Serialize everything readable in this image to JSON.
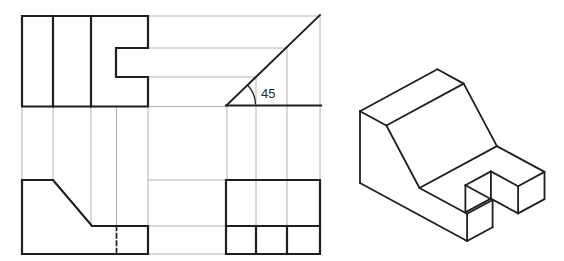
{
  "canvas": {
    "width": 564,
    "height": 261,
    "background": "#ffffff"
  },
  "colors": {
    "outline": "#1f1f1f",
    "projection": "#b4b4b4",
    "label": "#2a2a2a"
  },
  "angle_dimension": {
    "label": "45",
    "x": 261,
    "y": 98,
    "font_size": 13
  },
  "orthographic": {
    "top_view": {
      "outline": "M22,16 H148 V48 H116 V77 H148 V106.5 H22 Z",
      "edges": [
        [
          53,
          16,
          53,
          106.5
        ],
        [
          91,
          16,
          91,
          106.5
        ]
      ]
    },
    "front_view": {
      "outline": "M22,180 H53 L92,226 H148 V254 H22 Z",
      "hidden_edges": [
        [
          116.5,
          226,
          116.5,
          254
        ]
      ]
    },
    "side_view": {
      "outline": "M226,180 H320 V254 H226 Z",
      "edges": [
        [
          226,
          226,
          320,
          226
        ],
        [
          256,
          226,
          256,
          254
        ],
        [
          287,
          226,
          287,
          254
        ]
      ]
    },
    "miter": {
      "baseline": [
        226,
        105.5,
        321,
        105.5
      ],
      "diagonal": [
        227,
        105,
        320,
        15
      ],
      "arc": "M255.5,104.5 A28.5,28.5 0 0 0 247.2,84.8"
    }
  },
  "projection_lines": [
    [
      22,
      107,
      22,
      180
    ],
    [
      53,
      107,
      53,
      180
    ],
    [
      91,
      107,
      91,
      226
    ],
    [
      116.5,
      107,
      116.5,
      226
    ],
    [
      148,
      107,
      148,
      226
    ],
    [
      148,
      16,
      318,
      16
    ],
    [
      148,
      48,
      287,
      48
    ],
    [
      148,
      77,
      256,
      77
    ],
    [
      148,
      106.5,
      227,
      106.5
    ],
    [
      148,
      180,
      226,
      180
    ],
    [
      148,
      226,
      226,
      226
    ],
    [
      148,
      254,
      226,
      254
    ],
    [
      227,
      105,
      227,
      180
    ],
    [
      256,
      76,
      256,
      226
    ],
    [
      287,
      46,
      287,
      226
    ],
    [
      320,
      16,
      320,
      180
    ]
  ],
  "isometric": {
    "edges": [
      [
        360,
        111.2,
        437.4,
        69.3
      ],
      [
        437.4,
        69.3,
        463.7,
        83.6
      ],
      [
        463.7,
        83.6,
        386.4,
        125.5
      ],
      [
        386.4,
        125.5,
        360,
        111.2
      ],
      [
        360,
        111.2,
        360,
        183
      ],
      [
        386.4,
        125.5,
        419.5,
        188
      ],
      [
        463.7,
        83.6,
        496.9,
        146.1
      ],
      [
        419.5,
        188,
        496.9,
        146.1
      ],
      [
        419.5,
        188,
        467.1,
        213.8
      ],
      [
        496.9,
        146.1,
        544.5,
        171.9
      ],
      [
        360,
        183,
        467.1,
        241
      ],
      [
        467.1,
        213.8,
        467.1,
        241
      ],
      [
        467.1,
        213.8,
        492.6,
        200
      ],
      [
        492.6,
        200,
        465.4,
        185.2
      ],
      [
        465.4,
        185.2,
        490.9,
        171.4
      ],
      [
        490.9,
        171.4,
        518.1,
        186.2
      ],
      [
        518.1,
        186.2,
        544.5,
        171.9
      ],
      [
        544.5,
        171.9,
        544.5,
        199.1
      ],
      [
        544.5,
        199.1,
        518.1,
        213.4
      ],
      [
        518.1,
        186.2,
        518.1,
        213.4
      ],
      [
        465.4,
        185.2,
        465.4,
        212.4
      ],
      [
        490.9,
        171.4,
        490.9,
        198.6
      ],
      [
        465.4,
        212.4,
        490.9,
        198.6
      ],
      [
        490.9,
        198.6,
        518.1,
        213.4
      ],
      [
        492.6,
        200,
        492.6,
        227.2
      ],
      [
        467.1,
        241,
        492.6,
        227.2
      ]
    ]
  }
}
